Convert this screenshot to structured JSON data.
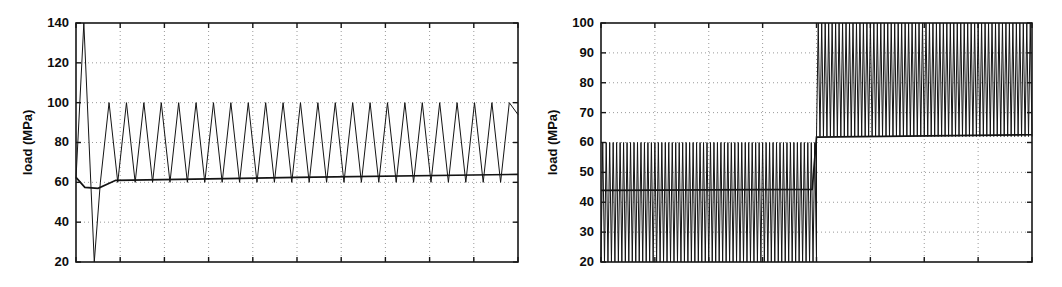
{
  "figure": {
    "background_color": "#ffffff",
    "line_color": "#141414",
    "grid_color": "#9a9a9a",
    "axis_color": "#171717",
    "width": 1062,
    "height": 287
  },
  "chart_data": [
    {
      "id": "left-panel",
      "type": "line",
      "title": "",
      "subtitle": "",
      "xlabel": "",
      "ylabel": "load (MPa)",
      "ylim": [
        20,
        140
      ],
      "yticks": [
        20,
        40,
        60,
        80,
        100,
        120,
        140
      ],
      "ytick_labels": [
        "20",
        "40",
        "60",
        "80",
        "100",
        "120",
        "140"
      ],
      "xlim": [
        0,
        25
      ],
      "xticks": [
        0,
        2.5,
        5,
        7.5,
        10,
        12.5,
        15,
        17.5,
        20,
        22.5,
        25
      ],
      "xtick_labels": [
        "",
        "",
        "",
        "",
        "",
        "",
        "",
        "",
        "",
        "",
        ""
      ],
      "grid": true,
      "grid_style": "dotted",
      "legend": "none",
      "plot_box": {
        "left": 76,
        "top": 23,
        "right": 518,
        "bottom": 262
      },
      "annotations": [
        "first cycle overshoots to 140 MPa then undershoots to 20 MPa",
        "steady sawtooth oscillates between 60 and 100 MPa",
        "mean load line drifts slowly upward from ~61 to ~64 MPa"
      ],
      "series": [
        {
          "name": "load signal",
          "description": "sawtooth load history with large first-cycle transient",
          "waveform": "sawtooth",
          "cycles": 24,
          "transient_peak": 140,
          "transient_trough": 20,
          "start_value": 62,
          "steady_peak": 100,
          "steady_trough": 60,
          "x": [
            0,
            0.18,
            0.42,
            0.62,
            0.86,
            1.0
          ],
          "y": [
            62,
            140,
            57,
            20,
            61,
            100
          ]
        },
        {
          "name": "mean load",
          "description": "slowly rising mean of the load history",
          "waveform": "trend",
          "x": [
            0,
            0.02,
            0.05,
            0.09,
            0.5,
            1.0
          ],
          "y": [
            62.5,
            57.5,
            57.0,
            61.0,
            62.5,
            64.0
          ]
        }
      ]
    },
    {
      "id": "right-panel",
      "type": "line",
      "title": "",
      "subtitle": "",
      "xlabel": "",
      "ylabel": "load (MPa)",
      "ylim": [
        20,
        100
      ],
      "yticks": [
        20,
        30,
        40,
        50,
        60,
        70,
        80,
        90,
        100
      ],
      "ytick_labels": [
        "20",
        "30",
        "40",
        "50",
        "60",
        "70",
        "80",
        "90",
        "100"
      ],
      "xlim": [
        0,
        10
      ],
      "xticks": [
        0,
        1.25,
        2.5,
        3.75,
        5,
        6.25,
        7.5,
        8.75,
        10
      ],
      "xtick_labels": [
        "",
        "",
        "",
        "",
        "",
        "",
        "",
        "",
        ""
      ],
      "grid": true,
      "grid_style": "dotted",
      "legend": "none",
      "plot_box": {
        "left": 601,
        "top": 23,
        "right": 1032,
        "bottom": 262
      },
      "annotations": [
        "block 1 (first half): dense cycles between 20 and 60 MPa",
        "block 2 (second half): dense cycles between 62 and 100 MPa",
        "step change in mean load at mid-span from ~44 to ~62 MPa"
      ],
      "series": [
        {
          "name": "load signal",
          "description": "two-block high-density cyclic load history",
          "waveform": "dense-cyclic",
          "blocks": [
            {
              "name": "block-1",
              "x_start": 0.0,
              "x_end": 0.5,
              "min": 20,
              "max": 60,
              "cycles": 62
            },
            {
              "name": "block-2",
              "x_start": 0.5,
              "x_end": 1.0,
              "min": 62,
              "max": 100,
              "cycles": 62
            }
          ],
          "x": [
            0,
            0.5,
            0.5,
            1.0
          ],
          "y": [
            40,
            40,
            81,
            81
          ]
        },
        {
          "name": "mean load",
          "description": "block mean load with step at transition",
          "waveform": "step",
          "x": [
            0,
            0.49,
            0.5,
            1.0
          ],
          "y": [
            44.0,
            44.3,
            61.8,
            62.6
          ]
        }
      ]
    }
  ]
}
